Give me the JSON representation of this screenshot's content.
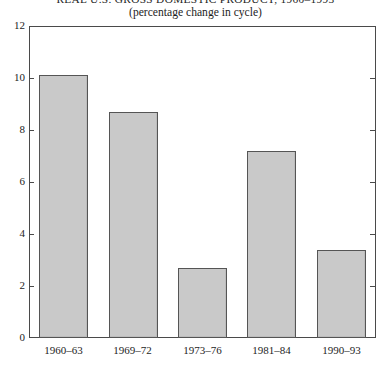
{
  "chart_data": {
    "type": "bar",
    "title": "REAL U.S. GROSS DOMESTIC PRODUCT, 1960–1993",
    "subtitle": "(percentage change in cycle)",
    "xlabel": "",
    "ylabel": "",
    "categories": [
      "1960–63",
      "1969–72",
      "1973–76",
      "1981–84",
      "1990–93"
    ],
    "values": [
      10.1,
      8.7,
      2.7,
      7.2,
      3.4
    ],
    "ylim": [
      0,
      12
    ],
    "yticks": [
      0,
      2,
      4,
      6,
      8,
      10,
      12
    ],
    "ytick_labels": [
      "0",
      "2",
      "4",
      "6",
      "8",
      "10",
      "12"
    ],
    "grid": false,
    "legend": null,
    "bar_color": "#c9c9c9",
    "bar_edge_color": "#555555",
    "axis_color": "#4a4a4a"
  }
}
